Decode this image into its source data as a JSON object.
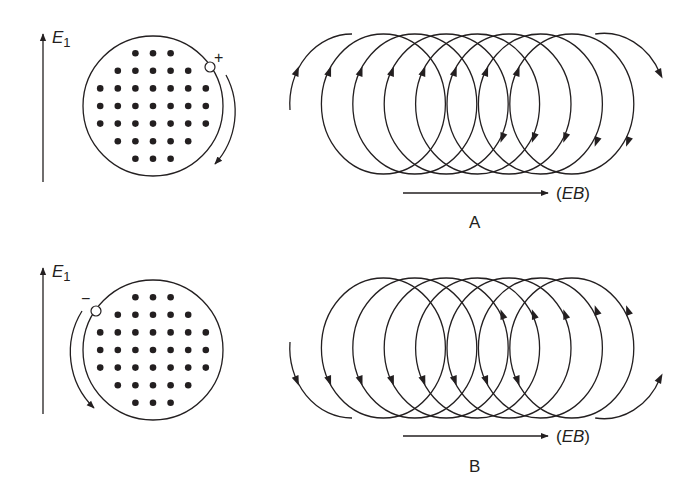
{
  "figure": {
    "panels": [
      {
        "id": "A",
        "letter": "A",
        "field_label": "E",
        "field_subscript": "1",
        "charge_sign": "+",
        "drift_label_open": "(",
        "drift_label_text": "EB",
        "drift_label_close": ")",
        "rotation": "clockwise",
        "dot_rows": [
          3,
          5,
          7,
          7,
          7,
          5,
          3
        ]
      },
      {
        "id": "B",
        "letter": "B",
        "field_label": "E",
        "field_subscript": "1",
        "charge_sign": "−",
        "drift_label_open": "(",
        "drift_label_text": "EB",
        "drift_label_close": ")",
        "rotation": "counterclockwise",
        "dot_rows": [
          3,
          5,
          7,
          7,
          7,
          5,
          3
        ]
      }
    ],
    "colors": {
      "ink": "#231f20",
      "background": "#ffffff"
    }
  }
}
